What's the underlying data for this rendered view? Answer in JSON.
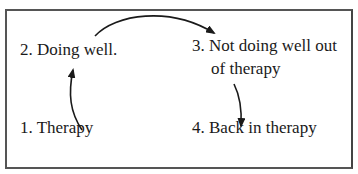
{
  "diagram": {
    "type": "cycle",
    "nodes": [
      {
        "id": 1,
        "label": "1.  Therapy"
      },
      {
        "id": 2,
        "label": "2.  Doing well."
      },
      {
        "id": 3,
        "label_line1": "3. Not doing well out",
        "label_line2": "of therapy"
      },
      {
        "id": 4,
        "label": "4.  Back in therapy"
      }
    ],
    "edges": [
      {
        "from": 1,
        "to": 2
      },
      {
        "from": 2,
        "to": 3
      },
      {
        "from": 3,
        "to": 4
      }
    ],
    "colors": {
      "border": "#555555",
      "arrow": "#1a1a1a",
      "text": "#1a1a1a",
      "background": "#ffffff"
    }
  }
}
